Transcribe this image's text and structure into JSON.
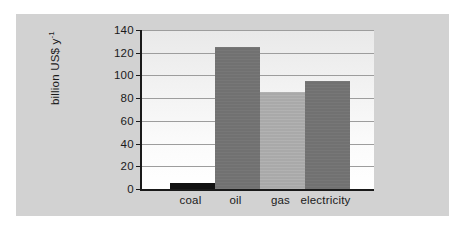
{
  "chart_data": {
    "type": "bar",
    "title": "",
    "subtitle": "",
    "xlabel": "",
    "ylabel": "billion US$ y",
    "ylabel_exponent": "-1",
    "categories": [
      "coal",
      "oil",
      "gas",
      "electricity"
    ],
    "values": [
      5.5,
      125,
      85,
      95
    ],
    "series": [
      {
        "name": "annual subsidy",
        "values": [
          5.5,
          125,
          85,
          95
        ]
      }
    ],
    "ylim": [
      0,
      140
    ],
    "ytick_labels": [
      "0",
      "20",
      "40",
      "60",
      "80",
      "100",
      "120",
      "140"
    ],
    "ytick_values": [
      0,
      20,
      40,
      60,
      80,
      100,
      120,
      140
    ],
    "grid": true,
    "legend": "none",
    "bar_colors": [
      "#111111",
      "#717171",
      "#a9a9a9",
      "#717171"
    ],
    "colors": {
      "page_background": "#ffffff",
      "panel_background": "#d2d2d2",
      "plot_background_top": "#e9e9e9",
      "plot_background_bottom": "#ffffff",
      "axis_line": "#1a1a1a",
      "gridline": "#9d9d9d",
      "text": "#1a1a1a"
    }
  }
}
